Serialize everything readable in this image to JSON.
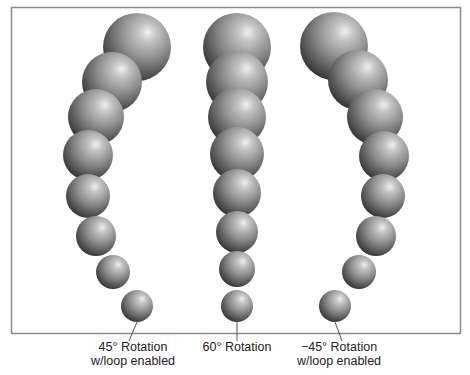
{
  "figure": {
    "columns": [
      {
        "id": "left",
        "label_line1": "45° Rotation",
        "label_line2": "w/loop enabled",
        "rotation_degrees": 45,
        "loop_enabled": true,
        "sphere_count": 8
      },
      {
        "id": "middle",
        "label_line1": "60° Rotation",
        "label_line2": "",
        "rotation_degrees": 60,
        "loop_enabled": false,
        "sphere_count": 8
      },
      {
        "id": "right",
        "label_line1": "−45° Rotation",
        "label_line2": "w/loop enabled",
        "rotation_degrees": -45,
        "loop_enabled": true,
        "sphere_count": 8
      }
    ],
    "colors": {
      "frame": "#8a8a8a",
      "sphere_highlight": "#e6e6e6",
      "sphere_mid": "#8c8c8c",
      "sphere_shadow": "#2e2e2e",
      "leader_line": "#555555",
      "caption_text": "#222222"
    }
  }
}
